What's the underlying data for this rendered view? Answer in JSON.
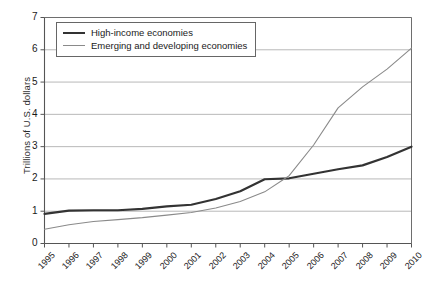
{
  "chart_data": {
    "type": "line",
    "title": "",
    "xlabel": "",
    "ylabel": "Trillions of U.S. dollars",
    "categories": [
      "1995",
      "1996",
      "1997",
      "1998",
      "1999",
      "2000",
      "2001",
      "2002",
      "2003",
      "2004",
      "2005",
      "2006",
      "2007",
      "2008",
      "2009",
      "2010"
    ],
    "ylim": [
      0,
      7
    ],
    "ytick_labels": [
      "0",
      "1",
      "2",
      "3",
      "4",
      "5",
      "6",
      "7"
    ],
    "yticks": [
      0,
      1,
      2,
      3,
      4,
      5,
      6,
      7
    ],
    "grid": "horizontal",
    "legend_position": "top-left-inside",
    "series": [
      {
        "name": "High-income economies",
        "color": "#333333",
        "width": 2.2,
        "values": [
          0.92,
          1.02,
          1.03,
          1.03,
          1.07,
          1.15,
          1.2,
          1.38,
          1.62,
          1.99,
          2.02,
          2.16,
          2.3,
          2.42,
          2.68,
          3.0
        ]
      },
      {
        "name": "Emerging and developing economies",
        "color": "#8a8a8a",
        "width": 1.1,
        "values": [
          0.44,
          0.58,
          0.68,
          0.74,
          0.8,
          0.88,
          0.96,
          1.1,
          1.3,
          1.6,
          2.1,
          3.05,
          4.2,
          4.85,
          5.4,
          6.05
        ]
      }
    ]
  },
  "legend": {
    "items": [
      {
        "label": "High-income economies"
      },
      {
        "label": "Emerging and developing economies"
      }
    ]
  }
}
